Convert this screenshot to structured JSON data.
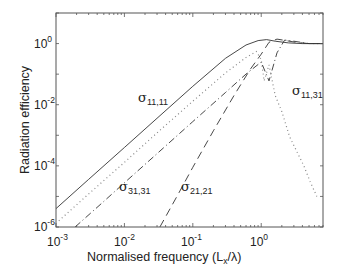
{
  "chart_data": {
    "type": "line",
    "title": "",
    "xlabel": "Normalised frequency (L_x/λ)",
    "ylabel": "Radiation efficiency",
    "xscale": "log",
    "yscale": "log",
    "xlim": [
      0.001,
      8
    ],
    "ylim": [
      1e-06,
      10
    ],
    "grid": false,
    "legend": "none (curves labelled inline)",
    "x_ticks": [
      {
        "base": "10",
        "exp": "-3",
        "value": 0.001
      },
      {
        "base": "10",
        "exp": "-2",
        "value": 0.01
      },
      {
        "base": "10",
        "exp": "-1",
        "value": 0.1
      },
      {
        "base": "10",
        "exp": "0",
        "value": 1
      }
    ],
    "y_ticks": [
      {
        "base": "10",
        "exp": "0",
        "value": 1
      },
      {
        "base": "10",
        "exp": "-2",
        "value": 0.01
      },
      {
        "base": "10",
        "exp": "-4",
        "value": 0.0001
      },
      {
        "base": "10",
        "exp": "-6",
        "value": 1e-06
      }
    ],
    "series": [
      {
        "name": "σ11,11",
        "style": "solid",
        "x": [
          0.001,
          0.003,
          0.01,
          0.03,
          0.1,
          0.3,
          0.6,
          0.9,
          1.2,
          1.6,
          2.5,
          4,
          8
        ],
        "y": [
          4e-06,
          3.6e-05,
          0.0004,
          0.0036,
          0.04,
          0.33,
          0.9,
          1.25,
          1.35,
          1.2,
          1.05,
          1.0,
          1.0
        ]
      },
      {
        "name": "σ11,31",
        "style": "dotted",
        "x": [
          0.0011,
          0.003,
          0.01,
          0.03,
          0.1,
          0.3,
          0.6,
          0.85,
          1.0,
          1.1,
          1.3,
          1.6,
          2.0,
          2.6,
          3.3,
          4.2,
          5.2,
          6.5
        ],
        "y": [
          1.6e-06,
          1.2e-05,
          0.00013,
          0.0012,
          0.013,
          0.11,
          0.35,
          0.55,
          0.3,
          0.06,
          0.2,
          0.02,
          0.006,
          0.0009,
          0.0003,
          0.0001,
          3e-05,
          1e-05
        ]
      },
      {
        "name": "σ31,31",
        "style": "dash-dot",
        "x": [
          0.0019,
          0.005,
          0.01,
          0.03,
          0.1,
          0.3,
          0.6,
          1.0,
          1.3,
          1.7,
          2.2,
          3,
          5,
          8
        ],
        "y": [
          1e-06,
          6.9e-06,
          2.8e-05,
          0.00025,
          0.0028,
          0.025,
          0.1,
          0.25,
          0.06,
          0.5,
          1.3,
          1.2,
          1.0,
          1.0
        ]
      },
      {
        "name": "σ21,21",
        "style": "dashed",
        "x": [
          0.033,
          0.06,
          0.1,
          0.2,
          0.4,
          0.7,
          1.0,
          1.3,
          1.7,
          2.3,
          3.2,
          5,
          8
        ],
        "y": [
          1e-06,
          1.1e-05,
          9e-05,
          0.0014,
          0.02,
          0.15,
          0.45,
          1.1,
          1.4,
          1.25,
          1.1,
          1.0,
          1.0
        ]
      }
    ],
    "annotations": [
      {
        "text": "σ11,11",
        "x": 0.028,
        "y": 0.025
      },
      {
        "text": "σ11,31",
        "x": 2.9,
        "y": 0.011
      },
      {
        "text": "σ31,31",
        "x": 0.0105,
        "y": 1.7e-05
      },
      {
        "text": "σ21,21",
        "x": 0.1,
        "y": 1.7e-05
      }
    ]
  },
  "labels": {
    "xlabel_main": "Normalised frequency (L",
    "xlabel_sub": "x",
    "xlabel_tail": "/λ)",
    "ylabel": "Radiation efficiency",
    "curve_labels": [
      {
        "sym": "σ",
        "sub": "11,11"
      },
      {
        "sym": "σ",
        "sub": "11,31"
      },
      {
        "sym": "σ",
        "sub": "31,31"
      },
      {
        "sym": "σ",
        "sub": "21,21"
      }
    ]
  }
}
